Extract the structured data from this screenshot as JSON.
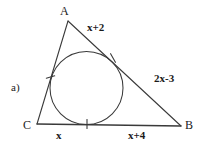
{
  "figure": {
    "item_label": "a)",
    "background_color": "#ffffff",
    "stroke_color": "#333333",
    "vertices": [
      {
        "name": "A",
        "label": "A",
        "x": 68,
        "y": 21
      },
      {
        "name": "B",
        "label": "B",
        "x": 181,
        "y": 126
      },
      {
        "name": "C",
        "label": "C",
        "x": 37,
        "y": 124
      }
    ],
    "incircle": {
      "cx": 86.5,
      "cy": 88,
      "r": 36.5
    },
    "side_labels": [
      {
        "name": "side-AB-upper",
        "text": "x+2"
      },
      {
        "name": "side-AB-lower",
        "text": "2x-3"
      },
      {
        "name": "side-CB-left",
        "text": "x"
      },
      {
        "name": "side-CB-right",
        "text": "x+4"
      }
    ],
    "tick_marks": [
      {
        "name": "tick-on-AC",
        "x": 50.5,
        "y": 77
      },
      {
        "name": "tick-on-AB",
        "x": 113,
        "y": 58
      },
      {
        "name": "tick-on-CB",
        "x": 87,
        "y": 124
      }
    ]
  }
}
